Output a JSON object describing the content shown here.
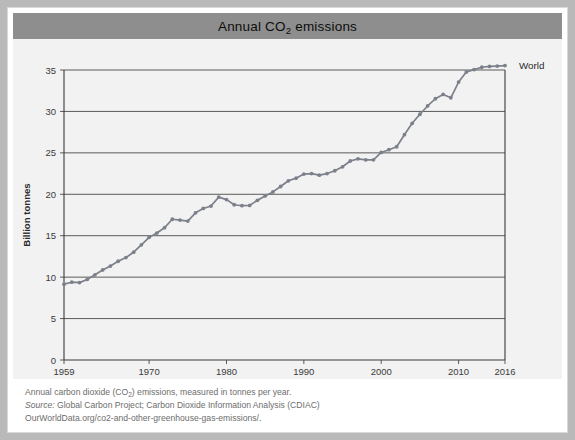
{
  "header": {
    "title_prefix": "Annual CO",
    "title_sub": "2",
    "title_suffix": " emissions",
    "title_full": "Annual CO2 emissions",
    "bar_color": "#8e8e8e"
  },
  "footer": {
    "line1_a": "Annual carbon dioxide (CO",
    "line1_sub": "2",
    "line1_b": ") emissions, measured in tonnes per year.",
    "line2_label": "Source:",
    "line2_text": " Global Carbon Project; Carbon Dioxide Information Analysis (CDIAC)",
    "line3": "OurWorldData.org/co2-and-other-greenhouse-gas-emissions/."
  },
  "chart_data": {
    "type": "line",
    "title": "Annual CO2 emissions",
    "xlabel": "",
    "ylabel": "Billion tonnes",
    "xlim": [
      1959,
      2016
    ],
    "ylim": [
      0,
      35
    ],
    "grid": true,
    "legend_position": "right-end",
    "line_color": "#7c808a",
    "marker": "circle",
    "series": [
      {
        "name": "World",
        "label": "World",
        "x": [
          1959,
          1960,
          1961,
          1962,
          1963,
          1964,
          1965,
          1966,
          1967,
          1968,
          1969,
          1970,
          1971,
          1972,
          1973,
          1974,
          1975,
          1976,
          1977,
          1978,
          1979,
          1980,
          1981,
          1982,
          1983,
          1984,
          1985,
          1986,
          1987,
          1988,
          1989,
          1990,
          1991,
          1992,
          1993,
          1994,
          1995,
          1996,
          1997,
          1998,
          1999,
          2000,
          2001,
          2002,
          2003,
          2004,
          2005,
          2006,
          2007,
          2008,
          2009,
          2010,
          2011,
          2012,
          2013,
          2014,
          2015,
          2016
        ],
        "values": [
          9.15,
          9.39,
          9.34,
          9.72,
          10.28,
          10.87,
          11.34,
          11.92,
          12.36,
          13.01,
          13.9,
          14.8,
          15.32,
          15.97,
          16.99,
          16.89,
          16.77,
          17.76,
          18.29,
          18.58,
          19.66,
          19.36,
          18.74,
          18.62,
          18.66,
          19.27,
          19.8,
          20.29,
          20.94,
          21.63,
          21.95,
          22.44,
          22.5,
          22.31,
          22.5,
          22.84,
          23.32,
          24.02,
          24.28,
          24.16,
          24.16,
          25.05,
          25.38,
          25.74,
          27.19,
          28.57,
          29.66,
          30.66,
          31.53,
          32.05,
          31.65,
          33.54,
          34.76,
          35.05,
          35.33,
          35.43,
          35.47,
          35.53
        ]
      }
    ],
    "x_ticks": [
      1959,
      1970,
      1980,
      1990,
      2000,
      2010,
      2016
    ],
    "x_tick_labels": [
      "1959",
      "1970",
      "1980",
      "1990",
      "2000",
      "2010",
      "2016"
    ],
    "y_ticks": [
      0,
      5,
      10,
      15,
      20,
      25,
      30,
      35
    ],
    "y_tick_labels": [
      "0",
      "5",
      "10",
      "15",
      "20",
      "25",
      "30",
      "35"
    ]
  }
}
